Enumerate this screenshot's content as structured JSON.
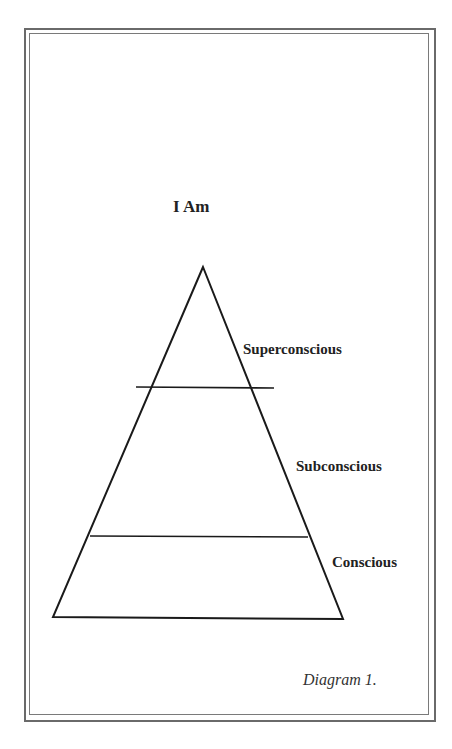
{
  "diagram": {
    "title": "I Am",
    "caption": "Diagram 1.",
    "layers": [
      {
        "label": "Superconscious"
      },
      {
        "label": "Subconscious"
      },
      {
        "label": "Conscious"
      }
    ],
    "colors": {
      "line": "#1a1a1a",
      "frame": "#6a6a6a",
      "text": "#222222"
    }
  }
}
